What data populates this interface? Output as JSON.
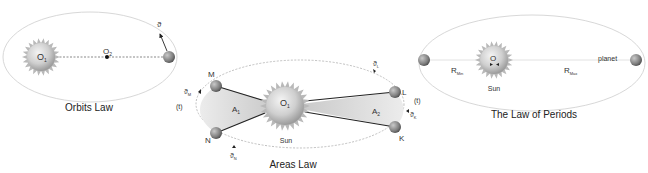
{
  "diagrams": {
    "orbits": {
      "title": "Orbits Law",
      "focus1": "O",
      "focus1_sub": "1",
      "focus2": "O",
      "focus2_sub": "2",
      "velocity": "ϑ"
    },
    "areas": {
      "title": "Areas Law",
      "sun_center": "O",
      "sun_center_sub": "1",
      "sun_label": "Sun",
      "points": [
        "M",
        "N",
        "L",
        "K"
      ],
      "area1": "A",
      "area1_sub": "1",
      "area2": "A",
      "area2_sub": "2",
      "time_left": "(t)",
      "time_right": "(t)",
      "vel_M": "ϑ",
      "vel_M_sub": "M",
      "vel_N": "ϑ",
      "vel_N_sub": "N",
      "vel_L": "ϑ",
      "vel_L_sub": "L",
      "vel_K": "ϑ",
      "vel_K_sub": "K"
    },
    "periods": {
      "title": "The Law of Periods",
      "sun_center": "O",
      "sun_label": "Sun",
      "planet_label": "planet",
      "r_min": "R",
      "r_min_sub": "Min",
      "r_max": "R",
      "r_max_sub": "Max"
    }
  },
  "colors": {
    "orbit_line": "#d6d6d6",
    "dashed_line": "#9a9a9a",
    "sun_body": "#c8c8c8",
    "area_fill": "#d9d9d9",
    "text": "#222222"
  }
}
